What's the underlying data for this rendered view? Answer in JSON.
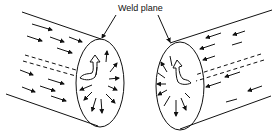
{
  "diagram": {
    "label": "Weld plane",
    "parts": [
      {
        "name": "left-cylinder",
        "flow_direction": "right"
      },
      {
        "name": "right-cylinder",
        "flow_direction": "left"
      }
    ],
    "colors": {
      "stroke": "#111111",
      "background": "#ffffff"
    }
  }
}
